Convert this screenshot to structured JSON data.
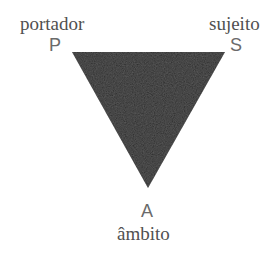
{
  "diagram": {
    "shape": "inverted-triangle",
    "fill_color": "#2b2b2b",
    "vertices": {
      "top_left": {
        "letter": "P",
        "word": "portador",
        "x": 72,
        "y": 52
      },
      "top_right": {
        "letter": "S",
        "word": "sujeito",
        "x": 225,
        "y": 52
      },
      "bottom": {
        "letter": "A",
        "word": "âmbito",
        "x": 148,
        "y": 188
      }
    }
  }
}
